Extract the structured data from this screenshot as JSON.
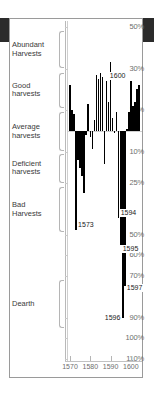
{
  "figure": {
    "frame_color": "#9a9a9a",
    "bar_color": "#000000",
    "axis_color": "#b9b9b9"
  },
  "chart_data": {
    "type": "bar",
    "title": "",
    "subtitle": "",
    "xlabel": "",
    "ylabel": "",
    "orientation": "vertical",
    "grid": false,
    "legend": null,
    "xlim": [
      1569,
      1605
    ],
    "ylim": [
      -110,
      50
    ],
    "y_axis_note": "Percentage deviation; positive values above the 0 baseline are better-than-average harvests, negative values below are shortfalls. Tick labels are printed without sign.",
    "y_ticks": [
      {
        "label": "50%",
        "value": 50
      },
      {
        "label": "30%",
        "value": 30
      },
      {
        "label": "10%",
        "value": 10
      },
      {
        "label": "10%",
        "value": -10
      },
      {
        "label": "25%",
        "value": -25
      },
      {
        "label": "50%",
        "value": -50
      },
      {
        "label": "60%",
        "value": -60
      },
      {
        "label": "70%",
        "value": -70
      },
      {
        "label": "90%",
        "value": -90
      },
      {
        "label": "100%",
        "value": -100
      },
      {
        "label": "110%",
        "value": -110
      }
    ],
    "x_ticks": [
      {
        "label": "1570",
        "value": 1570
      },
      {
        "label": "1580",
        "value": 1580
      },
      {
        "label": "1590",
        "value": 1590
      },
      {
        "label": "1600",
        "value": 1600
      }
    ],
    "categories_bands": [
      {
        "label": "Abundant\nHarvests",
        "line1": "Abundant",
        "line2": "Harvests",
        "from": 50,
        "to": 30
      },
      {
        "label": "Good\nharvests",
        "line1": "Good",
        "line2": "harvests",
        "from": 30,
        "to": 10
      },
      {
        "label": "Average\nharvests",
        "line1": "Average",
        "line2": "harvests",
        "from": 10,
        "to": -10
      },
      {
        "label": "Deficient\nharvests",
        "line1": "Deficient",
        "line2": "harvests",
        "from": -10,
        "to": -25
      },
      {
        "label": "Bad\nHarvests",
        "line1": "Bad",
        "line2": "Harvests",
        "from": -25,
        "to": -50
      },
      {
        "label": "Dearth",
        "line1": "Dearth",
        "line2": "",
        "from": -70,
        "to": -100
      }
    ],
    "categories": [
      1570,
      1571,
      1572,
      1573,
      1574,
      1575,
      1576,
      1577,
      1578,
      1579,
      1580,
      1581,
      1582,
      1583,
      1584,
      1585,
      1586,
      1587,
      1588,
      1589,
      1590,
      1591,
      1592,
      1593,
      1594,
      1595,
      1596,
      1597,
      1598,
      1599,
      1600,
      1601,
      1602,
      1603,
      1604
    ],
    "values": [
      22,
      10,
      8,
      -48,
      -14,
      -18,
      -22,
      -30,
      -2,
      13,
      -3,
      -9,
      5,
      27,
      25,
      28,
      26,
      -16,
      24,
      14,
      33,
      6,
      -1,
      9,
      -42,
      -55,
      -90,
      -75,
      1,
      9,
      24,
      12,
      14,
      20,
      22
    ],
    "annotations": [
      {
        "label": "1573",
        "year": 1573,
        "value": -48
      },
      {
        "label": "1594",
        "year": 1594,
        "value": -42
      },
      {
        "label": "1595",
        "year": 1595,
        "value": -55
      },
      {
        "label": "1596",
        "year": 1596,
        "value": -90
      },
      {
        "label": "1597",
        "year": 1597,
        "value": -75
      },
      {
        "label": "1600",
        "year": 1600,
        "value": 24
      }
    ]
  },
  "labels": {
    "y": {
      "t50": "50%",
      "t30": "30%",
      "t10a": "10%",
      "t10b": "10%",
      "t25": "25%",
      "t50b": "50%",
      "t60": "60%",
      "t70": "70%",
      "t90": "90%",
      "t100": "100%",
      "t110": "110%"
    },
    "bands": {
      "abundant1": "Abundant",
      "abundant2": "Harvests",
      "good1": "Good",
      "good2": "harvests",
      "average1": "Average",
      "average2": "harvests",
      "deficient1": "Deficient",
      "deficient2": "harvests",
      "bad1": "Bad",
      "bad2": "Harvests",
      "dearth1": "Dearth"
    },
    "x": {
      "x1570": "1570",
      "x1580": "1580",
      "x1590": "1590",
      "x1600": "1600"
    },
    "ann": {
      "a1573": "1573",
      "a1594": "1594",
      "a1595": "1595",
      "a1596": "1596",
      "a1597": "1597",
      "a1600": "1600"
    }
  }
}
